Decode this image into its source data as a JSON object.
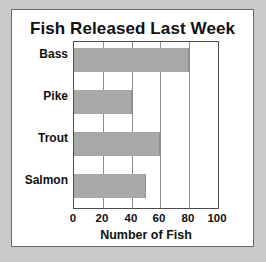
{
  "chart_data": {
    "type": "bar",
    "orientation": "horizontal",
    "title": "Fish Released Last Week",
    "xlabel": "Number of Fish",
    "ylabel": "",
    "categories": [
      "Bass",
      "Pike",
      "Trout",
      "Salmon"
    ],
    "values": [
      80,
      40,
      60,
      50
    ],
    "xlim": [
      0,
      100
    ],
    "xticks": [
      0,
      20,
      40,
      60,
      80,
      100
    ],
    "xtick_labels": [
      "0",
      "20",
      "40",
      "60",
      "80",
      "100"
    ],
    "grid": "vertical",
    "legend": "none",
    "series": [
      {
        "name": "Fish Released",
        "values": [
          80,
          40,
          60,
          50
        ]
      }
    ]
  },
  "colors": {
    "page_background": "#c9c9c9",
    "card_background": "#ffffff",
    "card_border": "#6b6b6b",
    "bar_fill": "#a8a8a8",
    "gridline": "#8c8c8c",
    "axis_frame": "#4d4d4d",
    "text": "#111111"
  }
}
